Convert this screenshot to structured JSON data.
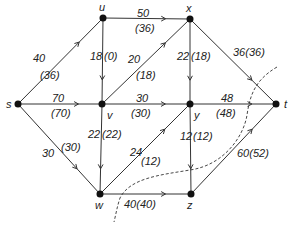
{
  "diagram": {
    "type": "flow-network",
    "nodes": [
      {
        "id": "s",
        "label": "s",
        "x": 18,
        "y": 104,
        "lx": 6,
        "ly": 108
      },
      {
        "id": "u",
        "label": "u",
        "x": 103,
        "y": 18,
        "lx": 99,
        "ly": 11
      },
      {
        "id": "x",
        "label": "x",
        "x": 190,
        "y": 19,
        "lx": 186,
        "ly": 12
      },
      {
        "id": "v",
        "label": "v",
        "x": 102,
        "y": 104,
        "lx": 107,
        "ly": 119
      },
      {
        "id": "y",
        "label": "y",
        "x": 190,
        "y": 104,
        "lx": 194,
        "ly": 119
      },
      {
        "id": "t",
        "label": "t",
        "x": 276,
        "y": 104,
        "lx": 284,
        "ly": 108
      },
      {
        "id": "w",
        "label": "w",
        "x": 100,
        "y": 194,
        "lx": 95,
        "ly": 209
      },
      {
        "id": "z",
        "label": "z",
        "x": 191,
        "y": 194,
        "lx": 187,
        "ly": 209
      }
    ],
    "edges": [
      {
        "from": "s",
        "to": "u",
        "capacity": "40",
        "flow": "(36)",
        "cap_pos": [
          33,
          62
        ],
        "flow_pos": [
          40,
          79
        ]
      },
      {
        "from": "u",
        "to": "x",
        "capacity": "50",
        "flow": "(36)",
        "cap_pos": [
          137,
          17
        ],
        "flow_pos": [
          135,
          32
        ]
      },
      {
        "from": "u",
        "to": "v",
        "capacity": "18",
        "flow": "(0)",
        "cap_pos": [
          90,
          60
        ],
        "flow_pos": [
          104,
          60
        ]
      },
      {
        "from": "v",
        "to": "x",
        "capacity": "20",
        "flow": "(18)",
        "cap_pos": [
          128,
          63
        ],
        "flow_pos": [
          136,
          79
        ]
      },
      {
        "from": "x",
        "to": "y",
        "capacity": "22",
        "flow": "(18)",
        "cap_pos": [
          177,
          60
        ],
        "flow_pos": [
          191,
          60
        ]
      },
      {
        "from": "x",
        "to": "t",
        "capacity": "36(36)",
        "flow": "",
        "cap_pos": [
          233,
          56
        ],
        "flow_pos": [
          0,
          0
        ]
      },
      {
        "from": "s",
        "to": "v",
        "capacity": "70",
        "flow": "(70)",
        "cap_pos": [
          52,
          102
        ],
        "flow_pos": [
          51,
          117
        ]
      },
      {
        "from": "v",
        "to": "y",
        "capacity": "30",
        "flow": "(30)",
        "cap_pos": [
          136,
          102
        ],
        "flow_pos": [
          131,
          117
        ]
      },
      {
        "from": "y",
        "to": "t",
        "capacity": "48",
        "flow": "(48)",
        "cap_pos": [
          221,
          102
        ],
        "flow_pos": [
          216,
          117
        ]
      },
      {
        "from": "s",
        "to": "w",
        "capacity": "30",
        "flow": "(30)",
        "cap_pos": [
          42,
          157
        ],
        "flow_pos": [
          61,
          151
        ]
      },
      {
        "from": "v",
        "to": "w",
        "capacity": "22",
        "flow": "(22)",
        "cap_pos": [
          88,
          138
        ],
        "flow_pos": [
          102,
          138
        ]
      },
      {
        "from": "w",
        "to": "y",
        "capacity": "24",
        "flow": "(12)",
        "cap_pos": [
          130,
          156
        ],
        "flow_pos": [
          141,
          165
        ]
      },
      {
        "from": "y",
        "to": "z",
        "capacity": "12",
        "flow": "(12)",
        "cap_pos": [
          180,
          140
        ],
        "flow_pos": [
          193,
          140
        ]
      },
      {
        "from": "w",
        "to": "z",
        "capacity": "40(40)",
        "flow": "",
        "cap_pos": [
          124,
          208
        ],
        "flow_pos": [
          0,
          0
        ]
      },
      {
        "from": "z",
        "to": "t",
        "capacity": "60(52)",
        "flow": "",
        "cap_pos": [
          237,
          157
        ],
        "flow_pos": [
          0,
          0
        ]
      }
    ],
    "cut": {
      "style": "dashed",
      "path": "M 277 67 C 255 80, 250 95, 247 115 C 244 135, 225 165, 190 170 C 160 175, 130 178, 120 198 C 117 207, 116 214, 114 222"
    }
  }
}
